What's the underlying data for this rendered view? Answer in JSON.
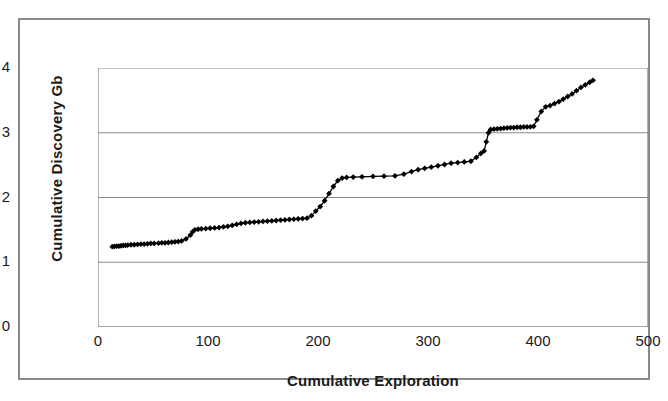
{
  "chart_data": {
    "type": "scatter",
    "title": "",
    "xlabel": "Cumulative Exploration",
    "ylabel": "Cumulative Discovery Gb",
    "xlim": [
      0,
      500
    ],
    "ylim": [
      0,
      4
    ],
    "xticks": [
      "0",
      "100",
      "200",
      "300",
      "400",
      "500"
    ],
    "yticks": [
      "0",
      "1",
      "2",
      "3",
      "4"
    ],
    "xtick_values": [
      0,
      100,
      200,
      300,
      400,
      500
    ],
    "ytick_values": [
      0,
      1,
      2,
      3,
      4
    ],
    "grid": "horizontal",
    "legend": "none",
    "marker": "diamond",
    "line_color": "#000000",
    "marker_color": "#000000",
    "series": [
      {
        "name": "Cumulative Discovery",
        "x": [
          13,
          15,
          17,
          19,
          21,
          23,
          25,
          27,
          30,
          33,
          36,
          39,
          42,
          45,
          48,
          51,
          55,
          58,
          61,
          64,
          67,
          70,
          73,
          76,
          80,
          84,
          86,
          88,
          91,
          94,
          98,
          102,
          106,
          110,
          114,
          118,
          122,
          126,
          130,
          134,
          138,
          142,
          146,
          150,
          154,
          158,
          162,
          166,
          170,
          174,
          178,
          182,
          186,
          190,
          194,
          198,
          202,
          206,
          210,
          214,
          218,
          222,
          226,
          232,
          240,
          250,
          260,
          270,
          278,
          285,
          291,
          297,
          303,
          309,
          315,
          321,
          327,
          333,
          339,
          344,
          348,
          351,
          353,
          355,
          357,
          360,
          363,
          366,
          369,
          372,
          375,
          378,
          381,
          384,
          387,
          390,
          393,
          396,
          399,
          403,
          407,
          411,
          415,
          419,
          423,
          427,
          431,
          435,
          439,
          443,
          447,
          450
        ],
        "y": [
          1.24,
          1.245,
          1.25,
          1.25,
          1.255,
          1.26,
          1.26,
          1.265,
          1.27,
          1.27,
          1.275,
          1.28,
          1.28,
          1.285,
          1.29,
          1.29,
          1.295,
          1.3,
          1.3,
          1.305,
          1.31,
          1.315,
          1.32,
          1.33,
          1.36,
          1.42,
          1.47,
          1.5,
          1.51,
          1.515,
          1.52,
          1.525,
          1.53,
          1.535,
          1.545,
          1.555,
          1.57,
          1.585,
          1.6,
          1.61,
          1.615,
          1.62,
          1.625,
          1.63,
          1.635,
          1.64,
          1.645,
          1.65,
          1.655,
          1.66,
          1.665,
          1.67,
          1.675,
          1.68,
          1.72,
          1.79,
          1.86,
          1.95,
          2.06,
          2.17,
          2.26,
          2.3,
          2.31,
          2.315,
          2.32,
          2.325,
          2.33,
          2.335,
          2.36,
          2.4,
          2.43,
          2.45,
          2.47,
          2.49,
          2.51,
          2.53,
          2.54,
          2.55,
          2.56,
          2.62,
          2.68,
          2.72,
          2.86,
          3.0,
          3.05,
          3.055,
          3.06,
          3.065,
          3.07,
          3.075,
          3.08,
          3.08,
          3.085,
          3.085,
          3.09,
          3.09,
          3.09,
          3.1,
          3.2,
          3.33,
          3.4,
          3.42,
          3.45,
          3.48,
          3.52,
          3.56,
          3.6,
          3.65,
          3.7,
          3.74,
          3.78,
          3.81
        ]
      }
    ]
  }
}
